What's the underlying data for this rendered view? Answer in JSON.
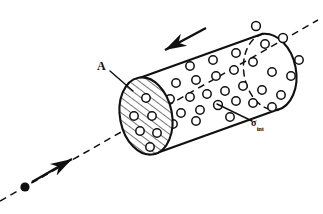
{
  "figure": {
    "background_color": "#ffffff",
    "ink_color": "#101010",
    "width": 323,
    "height": 214,
    "labels": {
      "area_label": "A",
      "cross_section_symbol": "σ",
      "cross_section_subscript": "int"
    },
    "annotations": [
      {
        "name": "area-label",
        "text": "A",
        "meaning": "cross-sectional area of cylinder end face",
        "x": 102,
        "y": 66
      },
      {
        "name": "cross-section-label",
        "text": "σint",
        "meaning": "interaction cross section of a target particle",
        "x": 256,
        "y": 124
      }
    ],
    "geometry": {
      "axis": {
        "name": "trajectory-axis",
        "style": "dashed",
        "x1": 0,
        "y1": 201,
        "x2": 318,
        "y2": 20
      },
      "cylinder": {
        "tilt_degrees": -30,
        "front_face": {
          "name": "hatched-area-disk",
          "center_x": 146,
          "center_y": 116,
          "rx": 26,
          "ry": 39,
          "fill": "diagonal-hatch"
        },
        "back_face": {
          "name": "back-end-cap",
          "center_x": 270,
          "center_y": 72,
          "rx": 26,
          "ry": 39
        }
      },
      "incoming_particle": {
        "name": "incident-particle-dot",
        "x": 25,
        "y": 187,
        "radius": 4.2
      },
      "incoming_arrow": {
        "name": "incident-direction-arrow",
        "x1": 30,
        "y1": 183,
        "x2": 70,
        "y2": 160
      },
      "length_arrow": {
        "name": "cylinder-length-arrow",
        "x1": 206,
        "y1": 28,
        "x2": 163,
        "y2": 51
      },
      "leader_lines": [
        {
          "name": "area-leader-line",
          "x1": 110,
          "y1": 71,
          "x2": 132,
          "y2": 90
        },
        {
          "name": "cross-section-leader-line",
          "x1": 251,
          "y1": 121,
          "x2": 218,
          "y2": 105
        }
      ],
      "target_particles_body": [
        {
          "x": 190,
          "y": 66,
          "r": 4.2
        },
        {
          "x": 213,
          "y": 60,
          "r": 4.2
        },
        {
          "x": 236,
          "y": 53,
          "r": 4.2
        },
        {
          "x": 256,
          "y": 26,
          "r": 4.4
        },
        {
          "x": 265,
          "y": 44,
          "r": 4.2
        },
        {
          "x": 283,
          "y": 38,
          "r": 4.4
        },
        {
          "x": 299,
          "y": 60,
          "r": 4.2
        },
        {
          "x": 253,
          "y": 62,
          "r": 4.2
        },
        {
          "x": 272,
          "y": 72,
          "r": 4.2
        },
        {
          "x": 291,
          "y": 76,
          "r": 4.2
        },
        {
          "x": 176,
          "y": 83,
          "r": 4.2
        },
        {
          "x": 196,
          "y": 80,
          "r": 4.2
        },
        {
          "x": 216,
          "y": 76,
          "r": 4.2
        },
        {
          "x": 234,
          "y": 70,
          "r": 4.2
        },
        {
          "x": 243,
          "y": 86,
          "r": 4.2
        },
        {
          "x": 262,
          "y": 90,
          "r": 4.2
        },
        {
          "x": 281,
          "y": 95,
          "r": 4.2
        },
        {
          "x": 170,
          "y": 99,
          "r": 4.2
        },
        {
          "x": 190,
          "y": 97,
          "r": 4.2
        },
        {
          "x": 207,
          "y": 94,
          "r": 4.2
        },
        {
          "x": 225,
          "y": 91,
          "r": 4.2
        },
        {
          "x": 253,
          "y": 103,
          "r": 4.2
        },
        {
          "x": 272,
          "y": 107,
          "r": 4.2
        },
        {
          "x": 181,
          "y": 113,
          "r": 4.2
        },
        {
          "x": 200,
          "y": 110,
          "r": 4.2
        },
        {
          "x": 218,
          "y": 105,
          "r": 4.4
        },
        {
          "x": 236,
          "y": 101,
          "r": 4.2
        },
        {
          "x": 173,
          "y": 124,
          "r": 4.2
        },
        {
          "x": 196,
          "y": 121,
          "r": 4.2
        },
        {
          "x": 230,
          "y": 117,
          "r": 4.2
        },
        {
          "x": 166,
          "y": 109,
          "r": 4.2
        }
      ],
      "target_particles_disk": [
        {
          "x": 146,
          "y": 98,
          "r": 4.2
        },
        {
          "x": 134,
          "y": 116,
          "r": 4.2
        },
        {
          "x": 152,
          "y": 116,
          "r": 4.2
        },
        {
          "x": 140,
          "y": 131,
          "r": 4.2
        },
        {
          "x": 157,
          "y": 133,
          "r": 4.2
        },
        {
          "x": 150,
          "y": 147,
          "r": 4.2
        }
      ]
    }
  }
}
